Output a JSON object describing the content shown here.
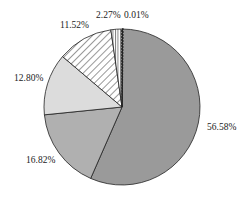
{
  "chart_data": {
    "type": "pie",
    "title": "",
    "start_angle": "12 o'clock, clockwise",
    "slices": [
      {
        "label": "56.58%",
        "value": 56.58,
        "fill": "#9a9a9a",
        "pattern": "solid"
      },
      {
        "label": "16.82%",
        "value": 16.82,
        "fill": "#b0b0b0",
        "pattern": "solid"
      },
      {
        "label": "12.80%",
        "value": 12.8,
        "fill": "#dcdcdc",
        "pattern": "solid"
      },
      {
        "label": "11.52%",
        "value": 11.52,
        "fill": "#ffffff",
        "pattern": "diagonal-hatch"
      },
      {
        "label": "2.27%",
        "value": 2.27,
        "fill": "#ffffff",
        "pattern": "vertical-stripes"
      },
      {
        "label": "0.01%",
        "value": 0.01,
        "fill": "#333333",
        "pattern": "dashed"
      }
    ],
    "legend": "none"
  },
  "labels": {
    "s0": "56.58%",
    "s1": "16.82%",
    "s2": "12.80%",
    "s3": "11.52%",
    "s4": "2.27%",
    "s5": "0.01%"
  }
}
